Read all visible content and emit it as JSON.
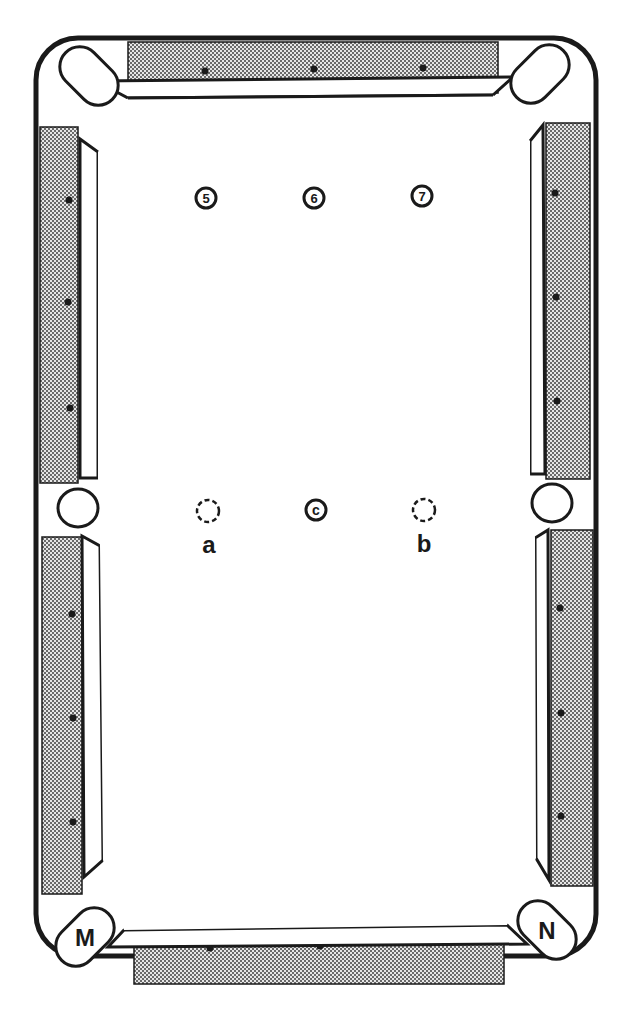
{
  "diagram": {
    "type": "pool-table",
    "colors": {
      "line": "#1a1a1a",
      "background": "#ffffff",
      "rail_fill": "#bdbdbd"
    },
    "balls": [
      {
        "label": "5",
        "x": 206,
        "y": 198,
        "style": "solid"
      },
      {
        "label": "6",
        "x": 314,
        "y": 198,
        "style": "solid"
      },
      {
        "label": "7",
        "x": 422,
        "y": 196,
        "style": "solid"
      },
      {
        "label": "c",
        "x": 316,
        "y": 510,
        "style": "solid"
      }
    ],
    "ghost_positions": [
      {
        "label": "a",
        "x": 208,
        "y": 511,
        "label_y": 553
      },
      {
        "label": "b",
        "x": 424,
        "y": 510,
        "label_y": 552
      }
    ],
    "pockets": [
      {
        "label": "M",
        "x": 85,
        "y": 937
      },
      {
        "label": "N",
        "x": 547,
        "y": 930
      }
    ]
  }
}
